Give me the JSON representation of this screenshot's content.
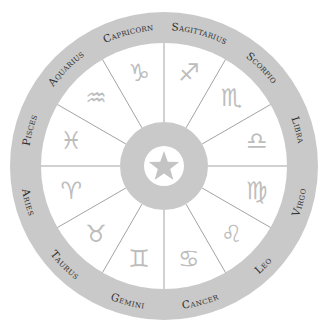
{
  "wheel": {
    "title": "Zodiac wheel",
    "colors": {
      "ring": "#c9c9c9",
      "label_text": "#2e2e2e",
      "glyph": "#bdbdbd",
      "divider": "#a3a3a3",
      "background": "#ffffff"
    },
    "center_icon": "star-icon",
    "signs": [
      {
        "name": "Sagittarius",
        "glyph": "♐",
        "icon": "sagittarius-icon"
      },
      {
        "name": "Scorpio",
        "glyph": "♏",
        "icon": "scorpio-icon"
      },
      {
        "name": "Libra",
        "glyph": "♎",
        "icon": "libra-icon"
      },
      {
        "name": "Virgo",
        "glyph": "♍",
        "icon": "virgo-icon"
      },
      {
        "name": "Leo",
        "glyph": "♌",
        "icon": "leo-icon"
      },
      {
        "name": "Cancer",
        "glyph": "♋",
        "icon": "cancer-icon"
      },
      {
        "name": "Gemini",
        "glyph": "♊",
        "icon": "gemini-icon"
      },
      {
        "name": "Taurus",
        "glyph": "♉",
        "icon": "taurus-icon"
      },
      {
        "name": "Aries",
        "glyph": "♈",
        "icon": "aries-icon"
      },
      {
        "name": "Pisces",
        "glyph": "♓",
        "icon": "pisces-icon"
      },
      {
        "name": "Aquarius",
        "glyph": "♒",
        "icon": "aquarius-icon"
      },
      {
        "name": "Capricorn",
        "glyph": "♑",
        "icon": "capricorn-icon"
      }
    ]
  }
}
